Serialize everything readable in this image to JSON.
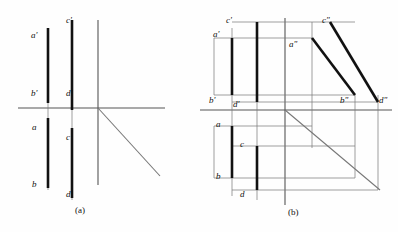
{
  "figure": {
    "type": "orthographic-projection-drawing",
    "width": 398,
    "height": 232,
    "background_color": "#fefefe",
    "axis_color": "#555555",
    "thin_line_color": "#777777",
    "thick_line_color": "#111111",
    "thick_line_width": 2.6,
    "thin_line_width": 0.7,
    "axis_line_width": 1.1
  },
  "panels": [
    {
      "id": "panel-a",
      "caption": "(a)",
      "caption_pos": {
        "x": 75,
        "y": 206
      },
      "origin": {
        "x": 98,
        "y": 108
      },
      "axes": {
        "horizontal": {
          "x1": 18,
          "y1": 108,
          "x2": 165,
          "y2": 108
        },
        "vertical": {
          "x1": 98,
          "y1": 20,
          "x2": 98,
          "y2": 185
        },
        "mitre_45": {
          "x1": 98,
          "y1": 108,
          "x2": 160,
          "y2": 176
        }
      },
      "projection_lines": [
        {
          "name": "vertical-through-ab",
          "x1": 48,
          "y1": 28,
          "x2": 48,
          "y2": 190
        },
        {
          "name": "vertical-through-cd",
          "x1": 72,
          "y1": 20,
          "x2": 72,
          "y2": 200
        }
      ],
      "segments": [
        {
          "name": "a-prime-b-prime",
          "x1": 48,
          "y1": 28,
          "x2": 48,
          "y2": 103,
          "weight": "thick"
        },
        {
          "name": "c-prime-d-prime",
          "x1": 72,
          "y1": 20,
          "x2": 72,
          "y2": 110,
          "weight": "thick"
        },
        {
          "name": "a-b",
          "x1": 48,
          "y1": 118,
          "x2": 48,
          "y2": 188,
          "weight": "thick"
        },
        {
          "name": "c-d",
          "x1": 72,
          "y1": 128,
          "x2": 72,
          "y2": 198,
          "weight": "thick"
        }
      ],
      "labels": [
        {
          "name": "label-a-prime",
          "text": "a'",
          "x": 31,
          "y": 31
        },
        {
          "name": "label-c-prime",
          "text": "c'",
          "x": 66,
          "y": 16
        },
        {
          "name": "label-b-prime",
          "text": "b'",
          "x": 31,
          "y": 89
        },
        {
          "name": "label-d-prime",
          "text": "d'",
          "x": 66,
          "y": 89
        },
        {
          "name": "label-a",
          "text": "a",
          "x": 32,
          "y": 123
        },
        {
          "name": "label-c",
          "text": "c",
          "x": 66,
          "y": 133
        },
        {
          "name": "label-b",
          "text": "b",
          "x": 32,
          "y": 180
        },
        {
          "name": "label-d",
          "text": "d",
          "x": 66,
          "y": 190
        }
      ]
    },
    {
      "id": "panel-b",
      "caption": "(b)",
      "caption_pos": {
        "x": 288,
        "y": 208
      },
      "origin": {
        "x": 285,
        "y": 110
      },
      "axes": {
        "horizontal": {
          "x1": 200,
          "y1": 110,
          "x2": 392,
          "y2": 110
        },
        "vertical": {
          "x1": 285,
          "y1": 18,
          "x2": 285,
          "y2": 205
        },
        "mitre_45": {
          "x1": 285,
          "y1": 110,
          "x2": 380,
          "y2": 190
        }
      },
      "projection_lines": [
        {
          "name": "vertical-through-ab",
          "x1": 232,
          "y1": 28,
          "x2": 232,
          "y2": 196
        },
        {
          "name": "vertical-through-cd",
          "x1": 257,
          "y1": 22,
          "x2": 257,
          "y2": 200
        },
        {
          "name": "vertical-through-a-dblprime",
          "x1": 312,
          "y1": 22,
          "x2": 312,
          "y2": 148
        },
        {
          "name": "vertical-through-b-dblprime",
          "x1": 355,
          "y1": 95,
          "x2": 355,
          "y2": 178
        },
        {
          "name": "vertical-through-d-dblprime",
          "x1": 378,
          "y1": 95,
          "x2": 378,
          "y2": 190
        },
        {
          "name": "horizontal-a-level",
          "x1": 214,
          "y1": 38,
          "x2": 312,
          "y2": 38
        },
        {
          "name": "horizontal-c-level",
          "x1": 232,
          "y1": 22,
          "x2": 355,
          "y2": 22
        },
        {
          "name": "horizontal-b-level",
          "x1": 214,
          "y1": 95,
          "x2": 355,
          "y2": 95
        },
        {
          "name": "horizontal-d-level",
          "x1": 232,
          "y1": 102,
          "x2": 378,
          "y2": 102
        },
        {
          "name": "horizontal-plan-a-level",
          "x1": 214,
          "y1": 126,
          "x2": 312,
          "y2": 126
        },
        {
          "name": "horizontal-plan-c-level",
          "x1": 232,
          "y1": 146,
          "x2": 355,
          "y2": 146
        },
        {
          "name": "horizontal-plan-b-level",
          "x1": 214,
          "y1": 178,
          "x2": 355,
          "y2": 178
        },
        {
          "name": "horizontal-plan-d-level",
          "x1": 232,
          "y1": 190,
          "x2": 378,
          "y2": 190
        },
        {
          "name": "box-left-cap-top",
          "x1": 214,
          "y1": 38,
          "x2": 214,
          "y2": 95
        },
        {
          "name": "box-left-cap-bottom",
          "x1": 214,
          "y1": 126,
          "x2": 214,
          "y2": 178
        }
      ],
      "segments": [
        {
          "name": "a-prime-b-prime",
          "x1": 232,
          "y1": 38,
          "x2": 232,
          "y2": 95,
          "weight": "thick"
        },
        {
          "name": "c-prime-d-prime",
          "x1": 257,
          "y1": 22,
          "x2": 257,
          "y2": 102,
          "weight": "thick"
        },
        {
          "name": "a-b",
          "x1": 232,
          "y1": 126,
          "x2": 232,
          "y2": 178,
          "weight": "thick"
        },
        {
          "name": "c-d",
          "x1": 257,
          "y1": 146,
          "x2": 257,
          "y2": 190,
          "weight": "thick"
        },
        {
          "name": "a-dblprime-b-dblprime",
          "x1": 312,
          "y1": 38,
          "x2": 355,
          "y2": 95,
          "weight": "thick"
        },
        {
          "name": "c-dblprime-d-dblprime",
          "x1": 330,
          "y1": 22,
          "x2": 378,
          "y2": 102,
          "weight": "thick"
        }
      ],
      "labels": [
        {
          "name": "label-c-prime",
          "text": "c'",
          "x": 226,
          "y": 16
        },
        {
          "name": "label-c-dblprime",
          "text": "c\"",
          "x": 322,
          "y": 16
        },
        {
          "name": "label-a-prime",
          "text": "a'",
          "x": 213,
          "y": 30
        },
        {
          "name": "label-a-dblprime",
          "text": "a\"",
          "x": 289,
          "y": 40
        },
        {
          "name": "label-b-prime",
          "text": "b'",
          "x": 209,
          "y": 96
        },
        {
          "name": "label-d-prime",
          "text": "d'",
          "x": 233,
          "y": 100
        },
        {
          "name": "label-b-dblprime",
          "text": "b\"",
          "x": 340,
          "y": 96
        },
        {
          "name": "label-d-dblprime",
          "text": "d\"",
          "x": 379,
          "y": 96
        },
        {
          "name": "label-a",
          "text": "a",
          "x": 216,
          "y": 120
        },
        {
          "name": "label-c",
          "text": "c",
          "x": 240,
          "y": 140
        },
        {
          "name": "label-b",
          "text": "b",
          "x": 216,
          "y": 172
        },
        {
          "name": "label-d",
          "text": "d",
          "x": 240,
          "y": 190
        }
      ]
    }
  ]
}
